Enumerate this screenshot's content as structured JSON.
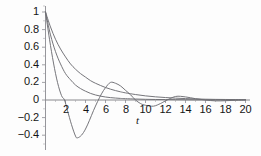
{
  "chart_data": {
    "type": "line",
    "title": "",
    "subtitle": "",
    "xlabel": "t",
    "ylabel": "",
    "xlim": [
      0,
      20
    ],
    "ylim": [
      -0.5,
      1.05
    ],
    "grid": false,
    "legend": false,
    "legend_position": "none",
    "xticks": [
      2,
      4,
      6,
      8,
      10,
      12,
      14,
      16,
      18,
      20
    ],
    "xtick_labels": [
      "2",
      "4",
      "6",
      "8",
      "10",
      "12",
      "14",
      "16",
      "18",
      "20"
    ],
    "yticks": [
      1,
      0.8,
      0.6,
      0.4,
      0.2,
      0,
      -0.2,
      -0.4
    ],
    "ytick_labels": [
      "1",
      "0.8",
      "0.6",
      "0.4",
      "0.2",
      "0",
      "−0.2",
      "−0.4"
    ],
    "line_color": "#6e6e73",
    "axis_color": "#7a7a80",
    "series": [
      {
        "name": "overdamped-slow",
        "description": "slowest monotonic decay, approaches 0 from above",
        "x": [
          0,
          0.5,
          1,
          1.5,
          2,
          2.5,
          3,
          3.5,
          4,
          4.5,
          5,
          5.5,
          6,
          6.5,
          7,
          7.5,
          8,
          9,
          10,
          11,
          12,
          13,
          14,
          15,
          16,
          17,
          18,
          19,
          20
        ],
        "y": [
          1.0,
          0.83,
          0.69,
          0.58,
          0.49,
          0.41,
          0.35,
          0.3,
          0.26,
          0.22,
          0.19,
          0.165,
          0.142,
          0.123,
          0.107,
          0.093,
          0.081,
          0.062,
          0.047,
          0.036,
          0.028,
          0.021,
          0.016,
          0.012,
          0.009,
          0.007,
          0.006,
          0.005,
          0.004
        ]
      },
      {
        "name": "critically-damped",
        "description": "medium monotonic decay, reaches near zero by t=8",
        "x": [
          0,
          0.5,
          1,
          1.5,
          2,
          2.5,
          3,
          3.5,
          4,
          4.5,
          5,
          5.5,
          6,
          6.5,
          7,
          7.5,
          8,
          9,
          10,
          11,
          12,
          13,
          14,
          15,
          16,
          17,
          18,
          19,
          20
        ],
        "y": [
          1.0,
          0.74,
          0.55,
          0.41,
          0.3,
          0.23,
          0.17,
          0.13,
          0.1,
          0.075,
          0.057,
          0.044,
          0.034,
          0.027,
          0.022,
          0.018,
          0.015,
          0.011,
          0.008,
          0.006,
          0.005,
          0.004,
          0.003,
          0.002,
          0.002,
          0.002,
          0.001,
          0.001,
          0.001
        ]
      },
      {
        "name": "underdamped-oscillatory",
        "description": "decaying oscillation: zero crossing t~1.9, minimum -0.43 at t~3.2, peak 0.2 at t~6.5, zero crossing t~9, shallow dip t~10.8, small bump 0.04 at t~13",
        "x": [
          0,
          0.4,
          0.8,
          1.2,
          1.6,
          1.9,
          2.2,
          2.6,
          3.0,
          3.2,
          3.6,
          4.0,
          4.4,
          4.8,
          5.2,
          5.6,
          6.0,
          6.5,
          7.0,
          7.5,
          8.0,
          8.5,
          9.0,
          9.5,
          10.0,
          10.8,
          11.5,
          12.0,
          13.0,
          14.0,
          15.0,
          16.0,
          17.0,
          18.0,
          19.0,
          20.0
        ],
        "y": [
          1.0,
          0.69,
          0.42,
          0.2,
          0.05,
          0.0,
          -0.12,
          -0.28,
          -0.41,
          -0.43,
          -0.4,
          -0.33,
          -0.23,
          -0.12,
          -0.02,
          0.07,
          0.14,
          0.2,
          0.19,
          0.16,
          0.11,
          0.06,
          0.0,
          -0.04,
          -0.06,
          -0.07,
          -0.04,
          -0.01,
          0.04,
          0.035,
          0.015,
          0.0,
          -0.01,
          -0.008,
          -0.003,
          0.0
        ]
      }
    ]
  },
  "axis": {
    "x_label": "t"
  }
}
